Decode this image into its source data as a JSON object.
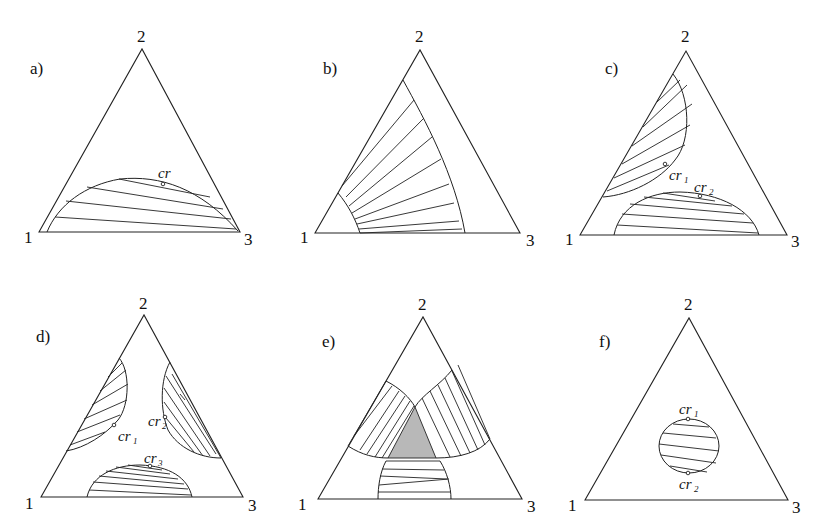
{
  "figure": {
    "vertex_labels": [
      "1",
      "2",
      "3"
    ],
    "panels": [
      {
        "id": "a",
        "label": "a)",
        "critical_points": [
          {
            "label": "cr",
            "sub": ""
          }
        ]
      },
      {
        "id": "b",
        "label": "b)",
        "critical_points": []
      },
      {
        "id": "c",
        "label": "c)",
        "critical_points": [
          {
            "label": "cr",
            "sub": "1"
          },
          {
            "label": "cr",
            "sub": "2"
          }
        ]
      },
      {
        "id": "d",
        "label": "d)",
        "critical_points": [
          {
            "label": "cr",
            "sub": "1"
          },
          {
            "label": "cr",
            "sub": "2"
          },
          {
            "label": "cr",
            "sub": "3"
          }
        ]
      },
      {
        "id": "e",
        "label": "e)",
        "critical_points": [],
        "shaded_region": "three-phase triangle",
        "shade_color": "#b8b8b8"
      },
      {
        "id": "f",
        "label": "f)",
        "critical_points": [
          {
            "label": "cr",
            "sub": "1"
          },
          {
            "label": "cr",
            "sub": "2"
          }
        ]
      }
    ]
  }
}
